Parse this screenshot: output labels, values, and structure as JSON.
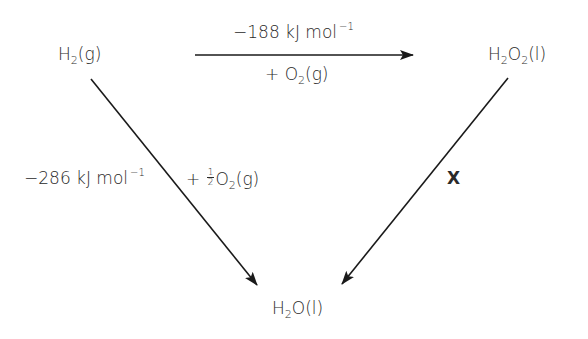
{
  "diagram": {
    "nodes": {
      "h2": {
        "base": "H",
        "sub": "2",
        "state": "(g)"
      },
      "h2o2": {
        "a": "H",
        "sub1": "2",
        "b": "O",
        "sub2": "2",
        "state": "(l)"
      },
      "h2o": {
        "a": "H",
        "sub": "2",
        "b": "O",
        "state": "(l)"
      }
    },
    "edges": {
      "top": {
        "from": "H2(g)",
        "to": "H2O2(l)",
        "enthalpy_value": "−188 kJ mol",
        "enthalpy_exp": "−1",
        "reagent_prefix": "+ O",
        "reagent_sub": "2",
        "reagent_state": "(g)"
      },
      "left": {
        "from": "H2(g)",
        "to": "H2O(l)",
        "enthalpy_value": "−286 kJ mol",
        "enthalpy_exp": "−1",
        "reagent_prefix": "+",
        "reagent_frac_num": "1",
        "reagent_frac_den": "2",
        "reagent_elem": "O",
        "reagent_sub": "2",
        "reagent_state": "(g)"
      },
      "right": {
        "from": "H2O2(l)",
        "to": "H2O(l)",
        "label": "X"
      }
    },
    "colors": {
      "stroke": "#1a1a1a",
      "text": "#2a2a2a",
      "background": "#ffffff"
    }
  }
}
